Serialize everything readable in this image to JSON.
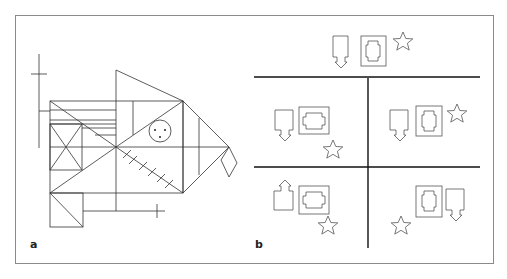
{
  "figure": {
    "panels": [
      {
        "id": "a",
        "label": "a",
        "description": "Complex geometric figure (fish-like Rey-Osterrieth style figure)"
      },
      {
        "id": "b",
        "label": "b",
        "description": "Spatial arrangement task with door-arrow, window block and star shapes in quadrants"
      }
    ]
  }
}
